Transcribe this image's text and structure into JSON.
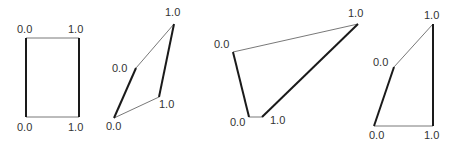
{
  "figure": {
    "colors": {
      "thin_edge": "#555555",
      "thick_edge": "#1a1a1a",
      "label": "#333333"
    },
    "shapes": [
      {
        "id": "rectangle",
        "vertices": {
          "top_left": [
            26,
            38
          ],
          "top_right": [
            79,
            38
          ],
          "bottom_right": [
            79,
            117
          ],
          "bottom_left": [
            26,
            117
          ]
        },
        "labels": {
          "top_left": {
            "text": "0.0",
            "x": 17,
            "y": 33
          },
          "top_right": {
            "text": "1.0",
            "x": 68,
            "y": 33
          },
          "bottom_left": {
            "text": "0.0",
            "x": 17,
            "y": 131
          },
          "bottom_right": {
            "text": "1.0",
            "x": 68,
            "y": 131
          }
        }
      },
      {
        "id": "skewed-quad-1",
        "vertices": {
          "top_left": [
            136,
            68
          ],
          "top_right": [
            174,
            24
          ],
          "bottom_right": [
            159,
            97
          ],
          "bottom_left": [
            114,
            118
          ]
        },
        "labels": {
          "top_left": {
            "text": "0.0",
            "x": 112,
            "y": 72
          },
          "top_right": {
            "text": "1.0",
            "x": 165,
            "y": 16
          },
          "bottom_left": {
            "text": "0.0",
            "x": 106,
            "y": 130
          },
          "bottom_right": {
            "text": "1.0",
            "x": 159,
            "y": 108
          }
        }
      },
      {
        "id": "skewed-quad-2",
        "vertices": {
          "top_left": [
            233,
            52
          ],
          "top_right": [
            358,
            24
          ],
          "bottom_right": [
            262,
            117
          ],
          "bottom_left": [
            249,
            117
          ]
        },
        "labels": {
          "top_left": {
            "text": "0.0",
            "x": 214,
            "y": 48
          },
          "top_right": {
            "text": "1.0",
            "x": 348,
            "y": 17
          },
          "bottom_left": {
            "text": "0.0",
            "x": 230,
            "y": 126
          },
          "bottom_right": {
            "text": "1.0",
            "x": 270,
            "y": 124
          }
        }
      },
      {
        "id": "skewed-quad-3",
        "vertices": {
          "top_left": [
            394,
            67
          ],
          "top_right": [
            433,
            24
          ],
          "bottom_right": [
            433,
            126
          ],
          "bottom_left": [
            374,
            126
          ]
        },
        "labels": {
          "top_left": {
            "text": "0.0",
            "x": 373,
            "y": 66
          },
          "top_right": {
            "text": "1.0",
            "x": 424,
            "y": 19
          },
          "bottom_left": {
            "text": "0.0",
            "x": 369,
            "y": 139
          },
          "bottom_right": {
            "text": "1.0",
            "x": 424,
            "y": 139
          }
        }
      }
    ]
  }
}
